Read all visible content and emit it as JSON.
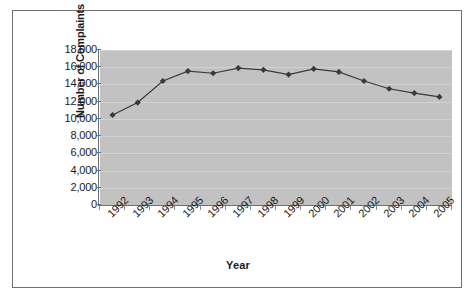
{
  "page": {
    "background": "#ffffff",
    "cutoff_header_text": "",
    "frame_border_color": "#6e6e6e"
  },
  "chart_data": {
    "type": "line",
    "title": "",
    "xlabel": "Year",
    "ylabel": "Number of Complaints",
    "categories": [
      "1992",
      "1993",
      "1994",
      "1995",
      "1996",
      "1997",
      "1998",
      "1999",
      "2000",
      "2001",
      "2002",
      "2003",
      "2004",
      "2005"
    ],
    "values": [
      10450,
      11900,
      14400,
      15550,
      15300,
      15900,
      15700,
      15150,
      15800,
      15450,
      14400,
      13500,
      13000,
      12550
    ],
    "series": [
      {
        "name": "Number of Complaints",
        "values": [
          10450,
          11900,
          14400,
          15550,
          15300,
          15900,
          15700,
          15150,
          15800,
          15450,
          14400,
          13500,
          13000,
          12550
        ]
      }
    ],
    "ylim": [
      0,
      18000
    ],
    "ytick_values": [
      18000,
      16000,
      14000,
      12000,
      10000,
      8000,
      6000,
      4000,
      2000,
      0
    ],
    "ytick_labels": [
      "18,000",
      "16,000",
      "14,000",
      "12,000",
      "10,000",
      "8,000",
      "6,000",
      "4,000",
      "2,000",
      "0"
    ],
    "grid": true,
    "grid_axis": "y",
    "legend": false,
    "legend_position": "none",
    "plot_background": "#c2c2c2",
    "gridline_color": "#d2d2d2",
    "series_color": "#3a3a3a",
    "marker": "diamond",
    "xtick_rotation": -45
  }
}
